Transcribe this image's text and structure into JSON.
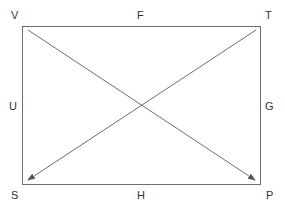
{
  "diagram": {
    "type": "rectangle-with-diagonal-arrows",
    "corners": {
      "top_left": "V",
      "top_right": "T",
      "bottom_left": "S",
      "bottom_right": "P"
    },
    "edges": {
      "top": "F",
      "right": "G",
      "bottom": "H",
      "left": "U"
    },
    "arrows": [
      {
        "from": "V",
        "to": "P"
      },
      {
        "from": "T",
        "to": "S"
      }
    ],
    "colors": {
      "stroke": "#6e6e6e",
      "text": "#333333",
      "background": "#ffffff"
    }
  }
}
